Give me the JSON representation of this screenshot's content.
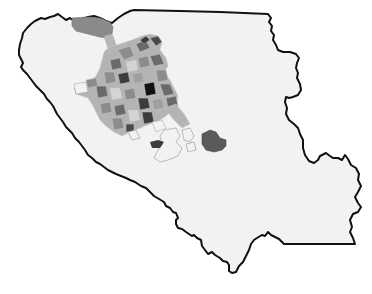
{
  "map": {
    "type": "choropleth",
    "style": "grayscale",
    "background": "#ffffff",
    "region_fill": "#f2f2f2",
    "border_color": "#111111",
    "shade_levels": [
      "#f2f2f2",
      "#d4d4d4",
      "#b0b0b0",
      "#8c8c8c",
      "#6a6a6a",
      "#3c3c3c",
      "#111111"
    ],
    "features": [
      {
        "name": "county-boundary",
        "description": "single county outline"
      },
      {
        "name": "urban-cluster",
        "description": "dense cluster of shaded tracts in the north-west"
      },
      {
        "name": "north-tract",
        "description": "large dark-gray tract along the northern border"
      },
      {
        "name": "east-tract",
        "description": "isolated dark-gray tract east of the cluster"
      }
    ]
  }
}
